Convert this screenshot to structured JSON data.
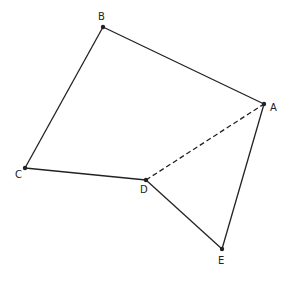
{
  "diagram": {
    "points": [
      {
        "id": "A",
        "label": "A",
        "x": 264,
        "y": 104,
        "lx": 270,
        "ly": 111
      },
      {
        "id": "B",
        "label": "B",
        "x": 103,
        "y": 27,
        "lx": 98,
        "ly": 20
      },
      {
        "id": "C",
        "label": "C",
        "x": 25,
        "y": 168,
        "lx": 15,
        "ly": 178
      },
      {
        "id": "D",
        "label": "D",
        "x": 146,
        "y": 180,
        "lx": 140,
        "ly": 193
      },
      {
        "id": "E",
        "label": "E",
        "x": 222,
        "y": 249,
        "lx": 218,
        "ly": 264
      }
    ],
    "segments": [
      {
        "from": "A",
        "to": "B",
        "style": "solid"
      },
      {
        "from": "B",
        "to": "C",
        "style": "solid"
      },
      {
        "from": "C",
        "to": "D",
        "style": "solid"
      },
      {
        "from": "D",
        "to": "E",
        "style": "solid"
      },
      {
        "from": "E",
        "to": "A",
        "style": "solid"
      },
      {
        "from": "D",
        "to": "A",
        "style": "dashed"
      }
    ],
    "line_color": "#222222"
  }
}
